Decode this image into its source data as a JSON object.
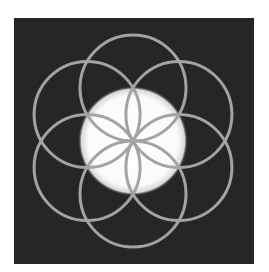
{
  "artwork": {
    "name": "Seed of Life",
    "background_color": "#262626",
    "page_color": "#ffffff",
    "glow_color": "#ffffff",
    "stroke_color": "#a3a3a3",
    "center": {
      "x": 133,
      "y": 141
    },
    "circle_radius": 53,
    "glow_radius": 51,
    "circle_count": 6
  }
}
